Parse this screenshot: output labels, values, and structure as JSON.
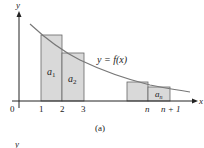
{
  "figure": {
    "caption": "(a)",
    "curve_label": "y = f(x)",
    "axes": {
      "x_label": "x",
      "y_label": "y",
      "origin_label": "0"
    },
    "x_ticks": [
      "1",
      "2",
      "3",
      "n",
      "n + 1"
    ],
    "rect_labels": {
      "a1": "a",
      "a1_sub": "1",
      "a2": "a",
      "a2_sub": "2",
      "an": "a",
      "an_sub": "n"
    },
    "next_panel_y_label": "y",
    "colors": {
      "rect_fill": "#d9d9d9",
      "rect_stroke": "#555555",
      "curve": "#777777",
      "axis": "#222222"
    }
  }
}
